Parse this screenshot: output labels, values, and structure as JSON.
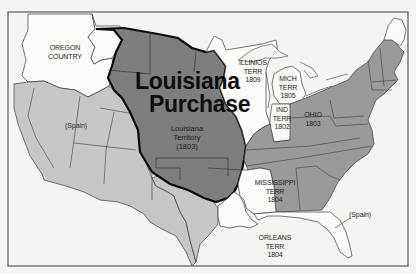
{
  "map": {
    "title_line1": "Louisiana",
    "title_line2": "Purchase",
    "colors": {
      "background": "#f4f4f2",
      "frame": "#3a3a3a",
      "louisiana": "#7e7e7e",
      "louisiana_border": "#0a0a0a",
      "states": "#9a9a9a",
      "spain": "#c6c6c6",
      "territories_unshaded": "#fbfbfa",
      "lines": "#3c3c3c"
    },
    "regions": [
      {
        "id": "oregon",
        "lines": [
          "OREGON",
          "COUNTRY"
        ]
      },
      {
        "id": "spain-west",
        "lines": [
          "(Spain)"
        ]
      },
      {
        "id": "louisiana-territory",
        "lines": [
          "Louisiana",
          "Territory",
          "(1803)"
        ]
      },
      {
        "id": "illinois",
        "lines": [
          "ILLINIOS",
          "TERR",
          "1809"
        ]
      },
      {
        "id": "michigan",
        "lines": [
          "MICH",
          "TERR",
          "1805"
        ]
      },
      {
        "id": "indiana",
        "lines": [
          "IND",
          "TERR",
          "1802"
        ]
      },
      {
        "id": "ohio",
        "lines": [
          "OHIO",
          "1803"
        ]
      },
      {
        "id": "mississippi",
        "lines": [
          "MISSISSIPPI",
          "TERR",
          "1804"
        ]
      },
      {
        "id": "orleans",
        "lines": [
          "ORLEANS",
          "TERR",
          "1804"
        ]
      },
      {
        "id": "spain-florida",
        "lines": [
          "(Spain)"
        ]
      }
    ]
  }
}
